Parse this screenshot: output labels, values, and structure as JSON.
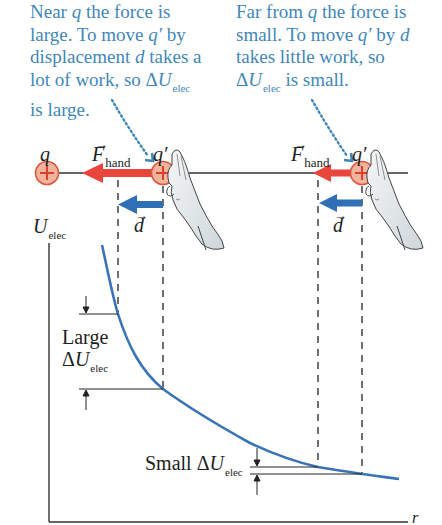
{
  "captions": {
    "near": {
      "line1_a": "Near ",
      "line1_q": "q",
      "line1_b": " the force is",
      "line2_a": "large. To move ",
      "line2_q": "q′",
      "line2_b": " by",
      "line3_a": "displacement ",
      "line3_d": "d",
      "line3_b": " takes a",
      "line4_a": "lot of work, so ",
      "line4_delta": "Δ",
      "line4_U": "U",
      "line4_sub": "elec",
      "line5": "is large."
    },
    "far": {
      "line1_a": "Far from ",
      "line1_q": "q",
      "line1_b": " the force is",
      "line2_a": "small. To move ",
      "line2_q": "q′",
      "line2_b": " by ",
      "line2_d": "d",
      "line3": "takes little work, so",
      "line4_delta": "Δ",
      "line4_U": "U",
      "line4_sub": "elec",
      "line4_b": " is small."
    }
  },
  "charges": {
    "source_label": "q",
    "test_label": "q′",
    "sign": "+"
  },
  "vectors": {
    "force_symbol": "F",
    "force_sub": "hand",
    "displacement_symbol": "d"
  },
  "graph": {
    "y_axis_symbol": "U",
    "y_axis_sub": "elec",
    "x_axis_label": "r",
    "large_label_word": "Large",
    "large_label_delta": "Δ",
    "large_label_U": "U",
    "large_label_sub": "elec",
    "small_label_word": "Small ",
    "small_label_delta": "Δ",
    "small_label_U": "U",
    "small_label_sub": "elec"
  },
  "colors": {
    "caption_text": "#3f87b9",
    "force_arrow": "#e8463c",
    "displacement_arrow": "#2f6fb5",
    "curve": "#3a74b8",
    "charge_fill": "#f2b49c",
    "charge_stroke": "#d9573f",
    "axis": "#333333"
  }
}
